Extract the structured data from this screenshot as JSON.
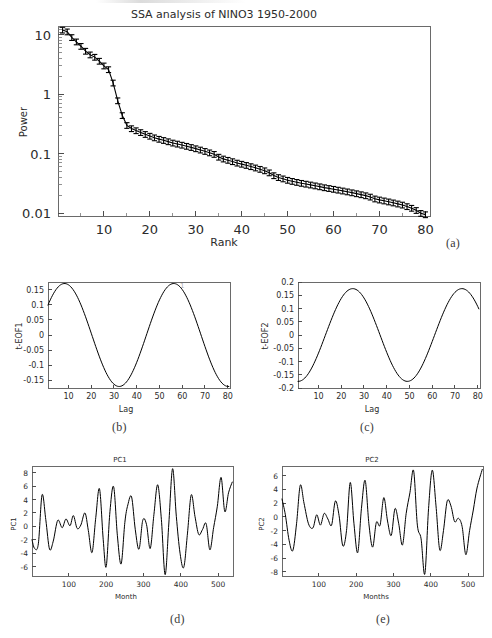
{
  "figure": {
    "caption_a": "(a)",
    "caption_b": "(b)",
    "caption_c": "(c)",
    "caption_d": "(d)",
    "caption_e": "(e)"
  },
  "panel_a": {
    "title": "SSA analysis of NINO3 1950-2000",
    "xlabel": "Rank",
    "ylabel": "Power",
    "xticks": [
      "10",
      "20",
      "30",
      "40",
      "50",
      "60",
      "70",
      "80"
    ],
    "yticks": [
      "10",
      "1",
      "0.1",
      "0.01"
    ]
  },
  "panel_b": {
    "ylabel": "t-EOF1",
    "xlabel": "Lag",
    "xticks": [
      "10",
      "20",
      "30",
      "40",
      "50",
      "60",
      "70",
      "80"
    ],
    "yticks": [
      "0.15",
      "0.1",
      "0.05",
      "0",
      "-0.05",
      "-0.1",
      "-0.15"
    ],
    "corner_mark": "1"
  },
  "panel_c": {
    "ylabel": "t-EOF2",
    "xlabel": "Lag",
    "xticks": [
      "10",
      "20",
      "30",
      "40",
      "50",
      "60",
      "70",
      "80"
    ],
    "yticks": [
      "0.2",
      "0.15",
      "0.1",
      "0.05",
      "0",
      "-0.05",
      "-0.1",
      "-0.15",
      "-0.2"
    ]
  },
  "panel_d": {
    "title": "PC1",
    "ylabel": "PC1",
    "xlabel": "Month",
    "xticks": [
      "100",
      "200",
      "300",
      "400",
      "500"
    ],
    "yticks": [
      "8",
      "6",
      "4",
      "2",
      "0",
      "-2",
      "-4",
      "-6"
    ]
  },
  "panel_e": {
    "title": "PC2",
    "ylabel": "PC2",
    "xlabel": "Months",
    "xticks": [
      "100",
      "200",
      "300",
      "400",
      "500"
    ],
    "yticks": [
      "6",
      "4",
      "2",
      "0",
      "-2",
      "-4",
      "-6",
      "-8"
    ]
  },
  "colors": {
    "line": "#000000",
    "axis": "#4d4d4d",
    "frame": "#6a6a6a",
    "text": "#2b2b2b",
    "caption": "#3a3a3a"
  },
  "chart_data": [
    {
      "type": "line",
      "name": "panel-a-eigenvalue-spectrum",
      "title": "SSA analysis of NINO3 1950-2000",
      "xlabel": "Rank",
      "ylabel": "Power",
      "yscale": "log",
      "xlim": [
        1,
        80
      ],
      "ylim": [
        0.009,
        14
      ],
      "grid": false,
      "legend": false,
      "errorbars": true,
      "x": [
        1,
        2,
        3,
        4,
        5,
        6,
        7,
        8,
        9,
        10,
        11,
        12,
        13,
        14,
        15,
        16,
        17,
        18,
        19,
        20,
        21,
        22,
        23,
        24,
        25,
        26,
        27,
        28,
        29,
        30,
        31,
        32,
        33,
        34,
        35,
        36,
        37,
        38,
        39,
        40,
        41,
        42,
        43,
        44,
        45,
        46,
        47,
        48,
        49,
        50,
        51,
        52,
        53,
        54,
        55,
        56,
        57,
        58,
        59,
        60,
        61,
        62,
        63,
        64,
        65,
        66,
        67,
        68,
        69,
        70,
        71,
        72,
        73,
        74,
        75,
        76,
        77,
        78,
        79,
        80
      ],
      "values": [
        12.0,
        11.2,
        9.0,
        7.6,
        6.4,
        5.3,
        4.6,
        4.2,
        3.6,
        3.0,
        2.6,
        1.55,
        0.78,
        0.44,
        0.3,
        0.265,
        0.245,
        0.228,
        0.212,
        0.198,
        0.186,
        0.176,
        0.168,
        0.16,
        0.152,
        0.146,
        0.14,
        0.134,
        0.128,
        0.122,
        0.116,
        0.11,
        0.104,
        0.098,
        0.088,
        0.082,
        0.078,
        0.074,
        0.07,
        0.067,
        0.064,
        0.061,
        0.058,
        0.055,
        0.052,
        0.048,
        0.043,
        0.04,
        0.038,
        0.036,
        0.0345,
        0.0332,
        0.032,
        0.031,
        0.03,
        0.029,
        0.028,
        0.027,
        0.0262,
        0.0254,
        0.0246,
        0.0238,
        0.023,
        0.0222,
        0.0214,
        0.0206,
        0.0198,
        0.0188,
        0.0175,
        0.0168,
        0.0162,
        0.0156,
        0.015,
        0.0144,
        0.0138,
        0.013,
        0.0122,
        0.0112,
        0.01,
        0.0095
      ],
      "yerr_rel": 0.11
    },
    {
      "type": "line",
      "name": "panel-b-temporal-eof1",
      "xlabel": "Lag",
      "ylabel": "t-EOF1",
      "xlim": [
        1,
        80
      ],
      "ylim": [
        -0.175,
        0.175
      ],
      "grid": false,
      "legend": false,
      "waveform": {
        "form": "cosine",
        "amplitude": 0.17,
        "period": 48,
        "phase_deg": -62,
        "value_at_x1": 0.09,
        "first_max": {
          "x": 6,
          "y": 0.12
        },
        "min": {
          "x": 28,
          "y": -0.168
        },
        "max": {
          "x": 52,
          "y": 0.172
        },
        "second_min": {
          "x": 75,
          "y": -0.118
        },
        "value_at_x80": -0.088
      }
    },
    {
      "type": "line",
      "name": "panel-c-temporal-eof2",
      "xlabel": "Lag",
      "ylabel": "t-EOF2",
      "xlim": [
        1,
        80
      ],
      "ylim": [
        -0.2,
        0.2
      ],
      "grid": false,
      "legend": false,
      "waveform": {
        "form": "cosine",
        "amplitude": 0.175,
        "period": 48,
        "phase_deg": 172,
        "value_at_x1": 0.02,
        "min": {
          "x": 16,
          "y": -0.158
        },
        "max": {
          "x": 40,
          "y": 0.185
        },
        "second_min": {
          "x": 64,
          "y": -0.152
        },
        "value_at_x80": 0.025
      }
    },
    {
      "type": "line",
      "name": "panel-d-pc1-timeseries",
      "title": "PC1",
      "xlabel": "Month",
      "ylabel": "PC1",
      "xlim": [
        1,
        540
      ],
      "ylim": [
        -7.4,
        9.0
      ],
      "grid": false,
      "legend": false,
      "x": [
        1,
        8,
        18,
        28,
        38,
        48,
        58,
        70,
        82,
        92,
        103,
        112,
        122,
        132,
        143,
        152,
        162,
        172,
        182,
        192,
        200,
        210,
        220,
        230,
        240,
        250,
        258,
        268,
        278,
        288,
        298,
        308,
        318,
        328,
        338,
        348,
        358,
        368,
        378,
        388,
        398,
        408,
        418,
        428,
        438,
        448,
        458,
        468,
        478,
        488,
        498,
        508,
        518,
        528,
        538
      ],
      "values": [
        -2.0,
        -3.3,
        -2.6,
        4.7,
        1.0,
        -3.4,
        -2.2,
        0.9,
        -0.2,
        1.1,
        0.1,
        1.6,
        -0.3,
        0.2,
        2.0,
        -0.6,
        -3.9,
        1.3,
        5.6,
        -2.0,
        -6.0,
        2.2,
        5.9,
        -1.4,
        -5.6,
        0.6,
        3.2,
        4.4,
        -0.5,
        -3.4,
        0.9,
        0.3,
        -3.3,
        1.8,
        6.2,
        1.0,
        -7.2,
        0.5,
        8.6,
        1.5,
        -4.0,
        -6.1,
        -1.0,
        4.7,
        1.5,
        -1.2,
        -0.5,
        0.4,
        -3.5,
        -0.2,
        3.0,
        7.3,
        2.2,
        5.0,
        6.6
      ]
    },
    {
      "type": "line",
      "name": "panel-e-pc2-timeseries",
      "title": "PC2",
      "xlabel": "Months",
      "ylabel": "PC2",
      "xlim": [
        1,
        540
      ],
      "ylim": [
        -8.6,
        7.4
      ],
      "grid": false,
      "legend": false,
      "x": [
        1,
        10,
        20,
        30,
        40,
        50,
        60,
        72,
        84,
        94,
        104,
        114,
        124,
        134,
        144,
        154,
        164,
        174,
        184,
        194,
        204,
        214,
        224,
        234,
        244,
        254,
        264,
        274,
        284,
        294,
        304,
        314,
        324,
        334,
        344,
        354,
        364,
        374,
        384,
        394,
        404,
        414,
        424,
        434,
        444,
        454,
        464,
        474,
        484,
        494,
        504,
        514,
        524,
        538
      ],
      "values": [
        2.6,
        0.3,
        -3.4,
        -4.9,
        -1.0,
        4.6,
        2.0,
        -1.0,
        -1.6,
        0.3,
        -1.2,
        0.5,
        -0.3,
        -1.2,
        2.3,
        0.2,
        -4.2,
        -2.0,
        5.0,
        -1.0,
        -5.2,
        1.2,
        5.3,
        -1.0,
        -4.4,
        -0.8,
        -1.2,
        2.8,
        -0.6,
        -2.7,
        1.2,
        -1.0,
        -4.1,
        0.5,
        3.5,
        6.7,
        -1.2,
        -3.2,
        -8.3,
        1.2,
        6.8,
        1.6,
        -4.8,
        -2.0,
        2.3,
        1.6,
        -0.7,
        -0.2,
        -1.4,
        -5.5,
        -2.0,
        1.0,
        4.2,
        6.9
      ]
    }
  ]
}
